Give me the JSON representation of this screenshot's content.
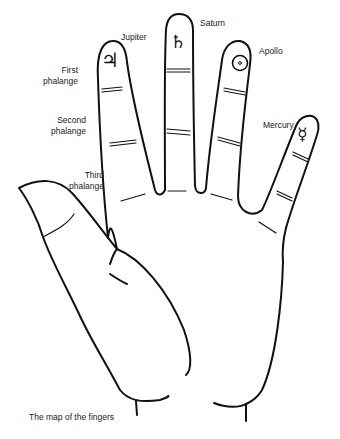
{
  "diagram": {
    "caption": "The map of the fingers",
    "fingers": [
      {
        "name": "Jupiter",
        "symbol": "♃",
        "icon": "jupiter-symbol-icon"
      },
      {
        "name": "Saturn",
        "symbol": "♄",
        "icon": "saturn-symbol-icon"
      },
      {
        "name": "Apollo",
        "symbol": "☉",
        "icon": "sun-symbol-icon"
      },
      {
        "name": "Mercury",
        "symbol": "☿",
        "icon": "mercury-symbol-icon"
      }
    ],
    "phalanges": [
      {
        "line1": "First",
        "line2": "phalange"
      },
      {
        "line1": "Second",
        "line2": "phalange"
      },
      {
        "line1": "Third",
        "line2": "phalange"
      }
    ],
    "colors": {
      "stroke": "#111111",
      "background": "#ffffff",
      "text": "#222222"
    }
  }
}
